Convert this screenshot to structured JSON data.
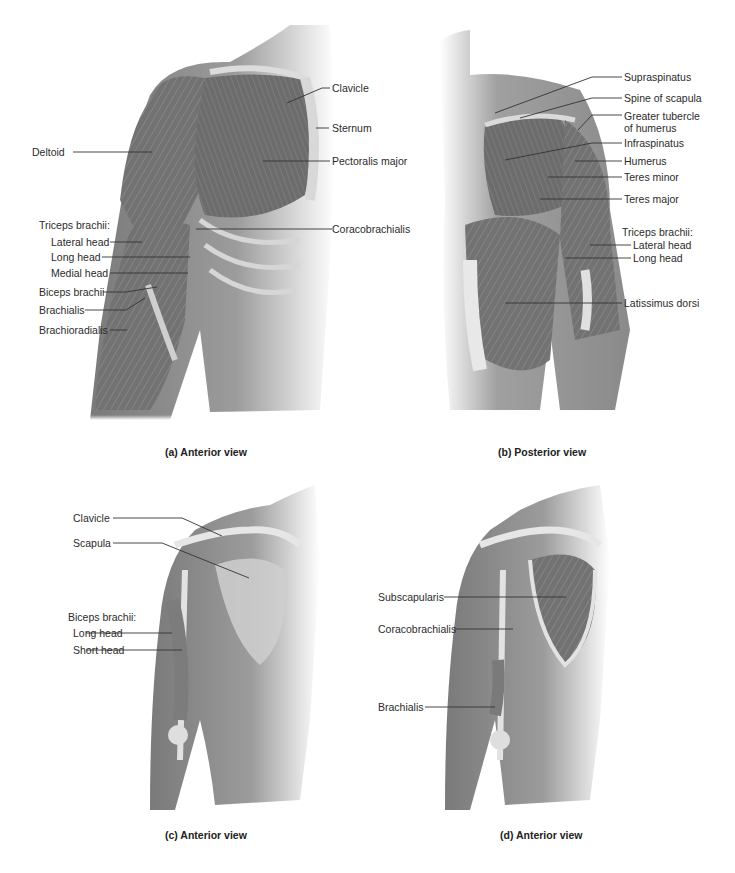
{
  "running_head": {
    "text": "",
    "page_number": ""
  },
  "panels": [
    {
      "id": "a",
      "caption": "(a) Anterior view",
      "labels": {
        "clavicle": "Clavicle",
        "sternum": "Sternum",
        "deltoid": "Deltoid",
        "pectoralis_major": "Pectoralis major",
        "triceps_group": "Triceps brachii:",
        "lateral_head": "Lateral head",
        "long_head": "Long head",
        "medial_head": "Medial head",
        "coracobrachialis": "Coracobrachialis",
        "biceps_brachii": "Biceps brachii",
        "brachialis": "Brachialis",
        "brachioradialis": "Brachioradialis"
      }
    },
    {
      "id": "b",
      "caption": "(b) Posterior view",
      "labels": {
        "supraspinatus": "Supraspinatus",
        "spine_of_scapula": "Spine of scapula",
        "greater_tubercle_1": "Greater tubercle",
        "greater_tubercle_2": "of humerus",
        "infraspinatus": "Infraspinatus",
        "humerus": "Humerus",
        "teres_minor": "Teres minor",
        "teres_major": "Teres major",
        "triceps_group": "Triceps brachii:",
        "lateral_head": "Lateral head",
        "long_head": "Long head",
        "latissimus_dorsi": "Latissimus dorsi"
      }
    },
    {
      "id": "c",
      "caption": "(c) Anterior view",
      "labels": {
        "clavicle": "Clavicle",
        "scapula": "Scapula",
        "biceps_group": "Biceps brachii:",
        "long_head": "Long head",
        "short_head": "Short head"
      }
    },
    {
      "id": "d",
      "caption": "(d) Anterior view",
      "labels": {
        "subscapularis": "Subscapularis",
        "coracobrachialis": "Coracobrachialis",
        "brachialis": "Brachialis"
      }
    }
  ],
  "colors": {
    "background": "#ffffff",
    "muscle_dark": "#6e6e6e",
    "muscle_mid": "#8c8c8c",
    "skin": "#9a9a9a",
    "bone": "#e4e4e4",
    "leader_line": "#333333"
  }
}
